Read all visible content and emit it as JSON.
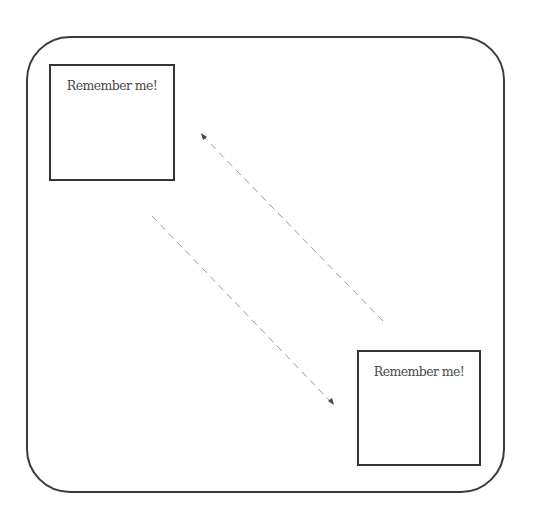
{
  "diagram": {
    "frame": {
      "shape": "rounded-rectangle",
      "stroke_color": "#3a3a3a"
    },
    "cards": [
      {
        "id": "top-left",
        "label": "Remember me!"
      },
      {
        "id": "bottom-right",
        "label": "Remember me!"
      }
    ],
    "arrows": [
      {
        "id": "arrow-to-top-left",
        "style": "dashed",
        "direction": "up-left",
        "color": "#999999"
      },
      {
        "id": "arrow-to-bottom-right",
        "style": "dashed",
        "direction": "down-right",
        "color": "#999999"
      }
    ]
  }
}
